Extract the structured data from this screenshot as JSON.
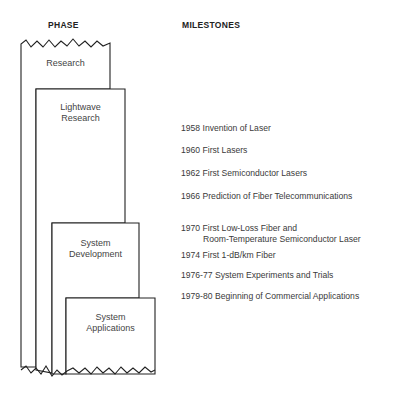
{
  "headers": {
    "phase": "PHASE",
    "milestones": "MILESTONES"
  },
  "phases": [
    {
      "id": "research",
      "label": "Research"
    },
    {
      "id": "lightwave-research",
      "label_line1": "Lightwave",
      "label_line2": "Research"
    },
    {
      "id": "system-development",
      "label_line1": "System",
      "label_line2": "Development"
    },
    {
      "id": "system-applications",
      "label_line1": "System",
      "label_line2": "Applications"
    }
  ],
  "milestones": [
    {
      "year": "1958",
      "text": "Invention of Laser"
    },
    {
      "year": "1960",
      "text": "First Lasers"
    },
    {
      "year": "1962",
      "text": "First Semiconductor Lasers"
    },
    {
      "year": "1966",
      "text": "Prediction of Fiber Telecommunications"
    },
    {
      "year": "1970",
      "text": "First Low-Loss Fiber and",
      "text2": "Room-Temperature Semiconductor Laser"
    },
    {
      "year": "1974",
      "text": "First 1-dB/km Fiber"
    },
    {
      "year": "1976-77",
      "text": "System Experiments and Trials"
    },
    {
      "year": "1979-80",
      "text": "Beginning of Commercial Applications"
    }
  ],
  "colors": {
    "line": "#222222",
    "text": "#3a3a3a",
    "background": "#ffffff"
  }
}
